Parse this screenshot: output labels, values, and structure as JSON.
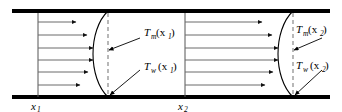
{
  "figure": {
    "type": "diagram",
    "background_color": "#ffffff",
    "line_color": "#000000",
    "wall_color": "#000000",
    "arrow_color": "#5a5a5a",
    "dashed_color": "#9a9a9a",
    "walls": {
      "top_label": "top-duct-wall",
      "bottom_label": "bottom-duct-wall"
    },
    "stations": [
      {
        "id": "station-1",
        "axial_label": "x",
        "axial_subscript": "1",
        "mean_temp": {
          "symbol": "T",
          "subscript": "m",
          "arg_open": "(x",
          "arg_sub": "1",
          "arg_close": ")"
        },
        "wall_temp": {
          "symbol": "T",
          "subscript": "w",
          "arg_open": "(x",
          "arg_sub": "1",
          "arg_close": ")"
        },
        "arrow_count": 6
      },
      {
        "id": "station-2",
        "axial_label": "x",
        "axial_subscript": "2",
        "mean_temp": {
          "symbol": "T",
          "subscript": "m",
          "arg_open": "(x",
          "arg_sub": "2",
          "arg_close": ")"
        },
        "wall_temp": {
          "symbol": "T",
          "subscript": "w",
          "arg_open": "(x",
          "arg_sub": "2",
          "arg_close": ")"
        },
        "arrow_count": 6
      }
    ]
  }
}
